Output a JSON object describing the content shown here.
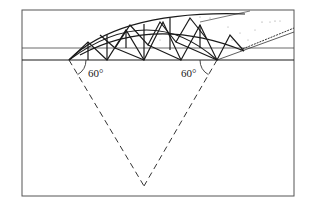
{
  "diagram": {
    "type": "structural truss arch dome section",
    "labels": {
      "left_angle": "60°",
      "right_angle": "60°"
    },
    "colors": {
      "stroke": "#1a1a1a",
      "frame": "#555555",
      "background": "#ffffff",
      "stipple": "#777777"
    },
    "geometry": {
      "frame": {
        "x": 22,
        "y": 10,
        "w": 272,
        "h": 186
      },
      "horizontal_lines_y": [
        48,
        60
      ],
      "supports": {
        "left": [
          69,
          60
        ],
        "right": [
          217,
          60
        ]
      },
      "apex": [
        144,
        186
      ],
      "angle_deg": 60
    }
  }
}
